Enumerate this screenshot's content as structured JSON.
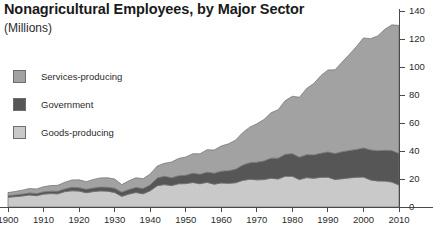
{
  "title": "Nonagricultural Employees, by Major Sector",
  "subtitle": "(Millions)",
  "legend": {
    "items": [
      {
        "label": "Services-producing",
        "color": "#a2a2a2",
        "key": "services"
      },
      {
        "label": "Government",
        "color": "#565656",
        "key": "government"
      },
      {
        "label": "Goods-producing",
        "color": "#c9c9c9",
        "key": "goods"
      }
    ]
  },
  "axes": {
    "x_ticks": [
      "1900",
      "1910",
      "1920",
      "1930",
      "1940",
      "1950",
      "1960",
      "1970",
      "1980",
      "1990",
      "2000",
      "2010"
    ],
    "y_ticks": [
      "0",
      "20",
      "40",
      "60",
      "80",
      "100",
      "120",
      "140"
    ],
    "y_axis_position": "right",
    "grid": false
  },
  "chart_data": {
    "type": "area",
    "stacked": true,
    "title": "Nonagricultural Employees, by Major Sector",
    "subtitle": "(Millions)",
    "xlabel": "",
    "ylabel": "Millions",
    "xlim": [
      1900,
      2010
    ],
    "ylim": [
      0,
      140
    ],
    "x_tick_step": 10,
    "y_tick_step": 20,
    "legend_position": "upper-left",
    "x": [
      1900,
      1902,
      1904,
      1906,
      1908,
      1910,
      1912,
      1914,
      1916,
      1918,
      1920,
      1922,
      1924,
      1926,
      1928,
      1930,
      1932,
      1934,
      1936,
      1938,
      1940,
      1942,
      1944,
      1946,
      1948,
      1950,
      1952,
      1954,
      1956,
      1958,
      1960,
      1962,
      1964,
      1966,
      1968,
      1970,
      1972,
      1974,
      1976,
      1978,
      1980,
      1982,
      1984,
      1986,
      1988,
      1990,
      1992,
      1994,
      1996,
      1998,
      2000,
      2002,
      2004,
      2006,
      2008,
      2010
    ],
    "series": [
      {
        "name": "Goods-producing",
        "color": "#c9c9c9",
        "values": [
          7.0,
          7.4,
          7.9,
          8.6,
          8.1,
          9.2,
          9.6,
          9.4,
          11.0,
          11.6,
          11.4,
          10.2,
          11.0,
          11.5,
          11.3,
          10.4,
          7.6,
          9.2,
          10.4,
          9.4,
          11.6,
          15.2,
          16.0,
          15.3,
          16.6,
          16.7,
          17.5,
          16.6,
          17.6,
          16.3,
          17.2,
          16.9,
          17.3,
          19.0,
          19.8,
          19.4,
          19.6,
          20.6,
          20.0,
          22.0,
          21.9,
          19.6,
          21.0,
          20.5,
          21.2,
          21.3,
          19.6,
          20.2,
          20.8,
          21.2,
          21.4,
          19.3,
          18.6,
          18.5,
          17.8,
          15.7
        ]
      },
      {
        "name": "Government",
        "color": "#565656",
        "values": [
          1.1,
          1.2,
          1.3,
          1.4,
          1.5,
          1.6,
          1.7,
          1.8,
          1.9,
          2.5,
          2.4,
          2.4,
          2.6,
          2.7,
          2.8,
          3.0,
          3.0,
          3.3,
          3.6,
          3.8,
          4.2,
          5.5,
          6.0,
          5.6,
          5.7,
          6.0,
          6.6,
          6.8,
          7.3,
          7.8,
          8.4,
          9.0,
          9.6,
          10.9,
          11.8,
          12.6,
          13.3,
          14.3,
          14.9,
          15.6,
          16.2,
          16.0,
          16.4,
          16.7,
          17.2,
          18.0,
          18.6,
          19.3,
          19.5,
          19.9,
          20.8,
          21.5,
          21.6,
          22.0,
          22.5,
          22.5
        ]
      },
      {
        "name": "Services-producing",
        "color": "#a2a2a2",
        "values": [
          2.2,
          2.5,
          2.8,
          3.2,
          3.3,
          3.7,
          4.0,
          4.3,
          4.8,
          5.2,
          5.6,
          5.5,
          6.1,
          6.6,
          6.8,
          6.6,
          5.4,
          6.2,
          6.9,
          7.0,
          7.8,
          8.6,
          9.2,
          11.2,
          12.4,
          13.0,
          14.0,
          14.6,
          16.0,
          16.6,
          18.0,
          19.2,
          20.8,
          23.2,
          25.4,
          27.4,
          29.6,
          32.4,
          34.6,
          38.4,
          41.0,
          42.8,
          47.2,
          51.0,
          55.4,
          58.6,
          59.8,
          64.0,
          68.6,
          73.4,
          78.6,
          79.4,
          82.0,
          86.4,
          89.8,
          91.5
        ]
      }
    ],
    "notes": [
      "Total peaks near 138 million around 2007-2008",
      "Great Depression trough visible around 1932-1933",
      "Sharp WWII expansion 1940-1944"
    ]
  }
}
